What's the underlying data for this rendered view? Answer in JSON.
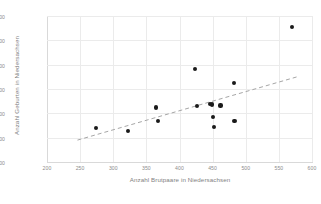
{
  "chart_data": {
    "type": "scatter",
    "title": "",
    "xlabel": "Anzahl Brutpaare in Niedersachsen",
    "ylabel": "Anzahl Geburten in Niedersachsen",
    "xlim": [
      200,
      600
    ],
    "ylim": [
      60000,
      90000
    ],
    "xticks": [
      200,
      250,
      300,
      350,
      400,
      450,
      500,
      550,
      600
    ],
    "yticks": [
      60000,
      65000,
      70000,
      75000,
      80000,
      85000,
      90000
    ],
    "xtick_labels": [
      "200",
      "250",
      "300",
      "350",
      "400",
      "450",
      "500",
      "550",
      "600"
    ],
    "ytick_labels": [
      "60000",
      "65000",
      "70000",
      "75000",
      "80000",
      "85000",
      "90000"
    ],
    "grid": true,
    "legend": false,
    "marker_color": "#1a1a1a",
    "trendline_color": "#a6a6a6",
    "points": [
      {
        "x": 274,
        "y": 67000
      },
      {
        "x": 322,
        "y": 66400
      },
      {
        "x": 364,
        "y": 71200
      },
      {
        "x": 368,
        "y": 68400
      },
      {
        "x": 424,
        "y": 79100
      },
      {
        "x": 426,
        "y": 71500
      },
      {
        "x": 446,
        "y": 72000
      },
      {
        "x": 449,
        "y": 71800
      },
      {
        "x": 451,
        "y": 69300
      },
      {
        "x": 452,
        "y": 67200
      },
      {
        "x": 462,
        "y": 71600
      },
      {
        "x": 482,
        "y": 76200
      },
      {
        "x": 483,
        "y": 68400
      },
      {
        "x": 570,
        "y": 87800
      }
    ],
    "trendline": {
      "x_start": 246,
      "y_start": 64500,
      "x_end": 580,
      "y_end": 77600
    }
  }
}
